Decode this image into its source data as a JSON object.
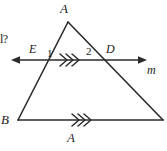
{
  "figure": {
    "kind": "geometry-diagram",
    "background_color": "#ffffff",
    "stroke_color": "#2b2b2b"
  },
  "labels": {
    "apex": "A",
    "bottom_left_vertex": "B",
    "intersection_left": "E",
    "intersection_right": "D",
    "line_name": "m",
    "angle_one": "1",
    "angle_two": "2",
    "cropped_question_fragment": "l?",
    "cropped_bottom_glyph": "A"
  },
  "geometry": {
    "triangle": {
      "apex": [
        68,
        22
      ],
      "bottom_left": [
        18,
        120
      ],
      "bottom_right": [
        163,
        120
      ]
    },
    "transversal": {
      "y": 60,
      "x_start": 12,
      "x_end": 146,
      "arrow_both_ends": true,
      "point_E": [
        35,
        60
      ],
      "point_D": [
        108,
        60
      ]
    },
    "base": {
      "y": 120,
      "x_start": 18,
      "x_end": 163
    },
    "parallel_marks": {
      "chevron_count": 3,
      "on_transversal_at": [
        70,
        60
      ],
      "on_base_at": [
        82,
        120
      ]
    }
  }
}
